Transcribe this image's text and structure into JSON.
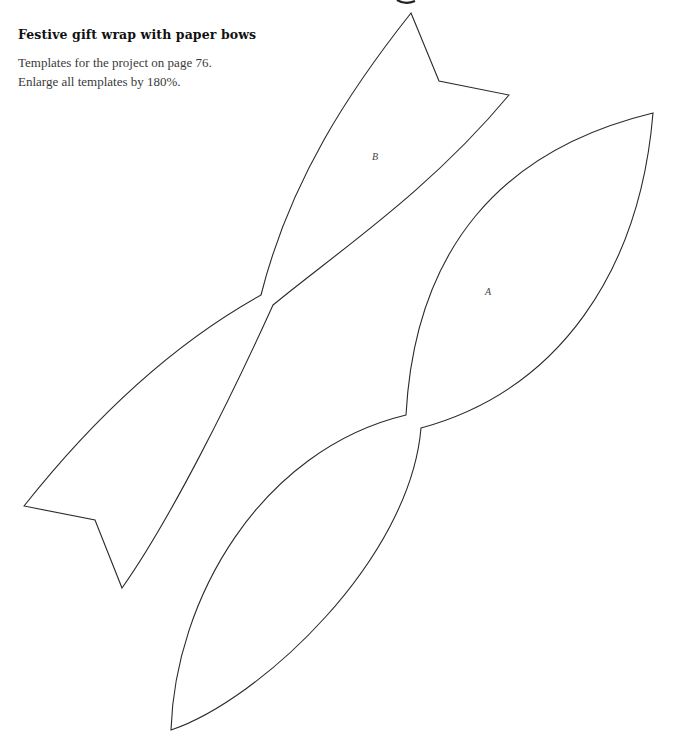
{
  "page": {
    "title": "Festive gift wrap with paper bows",
    "intro_lines": [
      "Templates for the project on page 76.",
      "Enlarge all templates by 180%."
    ]
  },
  "templates": [
    {
      "id": "A",
      "label": "A",
      "name": "bow-template-a"
    },
    {
      "id": "B",
      "label": "B",
      "name": "bow-template-b"
    }
  ],
  "colors": {
    "outline": "#2a2a2a",
    "text": "#3a3a3a",
    "title": "#111111"
  }
}
